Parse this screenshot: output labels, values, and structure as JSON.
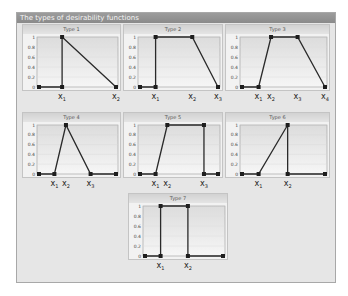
{
  "window": {
    "title": "The types of desirability functions"
  },
  "colors": {
    "line": "#2a2a2a",
    "marker": "#1e1e1e",
    "plot_bg": "#ececec",
    "plot_bg_top": "#dcdcdc",
    "frame_bg": "#e6e6e6",
    "title_bg": "#909090"
  },
  "chart_data": [
    {
      "type": "line",
      "title": "Type 1",
      "ylim": [
        0,
        1
      ],
      "yticks": [
        "1",
        "0.8",
        "0.6",
        "0.4",
        "0.2",
        "0"
      ],
      "x_labels": [
        {
          "name": "x",
          "sub": "1"
        },
        {
          "name": "x",
          "sub": "2"
        }
      ],
      "points": [
        [
          0,
          0
        ],
        [
          0.3,
          0
        ],
        [
          0.3,
          1
        ],
        [
          1,
          0
        ]
      ],
      "point_label_positions": [
        0.3,
        1.0
      ]
    },
    {
      "type": "line",
      "title": "Type 2",
      "ylim": [
        0,
        1
      ],
      "yticks": [
        "1",
        "0.8",
        "0.6",
        "0.4",
        "0.2",
        "0"
      ],
      "x_labels": [
        {
          "name": "x",
          "sub": "1"
        },
        {
          "name": "x",
          "sub": "2"
        },
        {
          "name": "x",
          "sub": "3"
        }
      ],
      "points": [
        [
          0,
          0
        ],
        [
          0.2,
          0
        ],
        [
          0.2,
          1
        ],
        [
          0.67,
          1
        ],
        [
          1,
          0
        ]
      ],
      "point_label_positions": [
        0.2,
        0.67,
        1.0
      ]
    },
    {
      "type": "line",
      "title": "Type 3",
      "ylim": [
        0,
        1
      ],
      "yticks": [
        "1",
        "0.8",
        "0.6",
        "0.4",
        "0.2",
        "0"
      ],
      "x_labels": [
        {
          "name": "x",
          "sub": "1"
        },
        {
          "name": "x",
          "sub": "2"
        },
        {
          "name": "x",
          "sub": "3"
        },
        {
          "name": "x",
          "sub": "4"
        }
      ],
      "points": [
        [
          0,
          0
        ],
        [
          0.2,
          0
        ],
        [
          0.35,
          1
        ],
        [
          0.67,
          1
        ],
        [
          1,
          0
        ]
      ],
      "point_label_positions": [
        0.2,
        0.35,
        0.67,
        1.0
      ]
    },
    {
      "type": "line",
      "title": "Type 4",
      "ylim": [
        0,
        1
      ],
      "yticks": [
        "1",
        "0.8",
        "0.6",
        "0.4",
        "0.2",
        "0"
      ],
      "x_labels": [
        {
          "name": "x",
          "sub": "1"
        },
        {
          "name": "x",
          "sub": "2"
        },
        {
          "name": "x",
          "sub": "3"
        }
      ],
      "points": [
        [
          0,
          0
        ],
        [
          0.2,
          0
        ],
        [
          0.35,
          1
        ],
        [
          0.67,
          0
        ],
        [
          1,
          0
        ]
      ],
      "point_label_positions": [
        0.2,
        0.35,
        0.67
      ]
    },
    {
      "type": "line",
      "title": "Type 5",
      "ylim": [
        0,
        1
      ],
      "yticks": [
        "1",
        "0.8",
        "0.6",
        "0.4",
        "0.2",
        "0"
      ],
      "x_labels": [
        {
          "name": "x",
          "sub": "1"
        },
        {
          "name": "x",
          "sub": "2"
        },
        {
          "name": "x",
          "sub": "3"
        }
      ],
      "points": [
        [
          0,
          0
        ],
        [
          0.2,
          0
        ],
        [
          0.35,
          1
        ],
        [
          0.82,
          1
        ],
        [
          0.82,
          0
        ],
        [
          1,
          0
        ]
      ],
      "point_label_positions": [
        0.2,
        0.35,
        0.82
      ]
    },
    {
      "type": "line",
      "title": "Type 6",
      "ylim": [
        0,
        1
      ],
      "yticks": [
        "1",
        "0.8",
        "0.6",
        "0.4",
        "0.2",
        "0"
      ],
      "x_labels": [
        {
          "name": "x",
          "sub": "1"
        },
        {
          "name": "x",
          "sub": "2"
        }
      ],
      "points": [
        [
          0,
          0
        ],
        [
          0.2,
          0
        ],
        [
          0.55,
          1
        ],
        [
          0.55,
          0
        ],
        [
          1,
          0
        ]
      ],
      "point_label_positions": [
        0.2,
        0.55
      ]
    },
    {
      "type": "line",
      "title": "Type 7",
      "ylim": [
        0,
        1
      ],
      "yticks": [
        "1",
        "0.8",
        "0.6",
        "0.4",
        "0.2",
        "0"
      ],
      "x_labels": [
        {
          "name": "x",
          "sub": "1"
        },
        {
          "name": "x",
          "sub": "2"
        }
      ],
      "points": [
        [
          0,
          0
        ],
        [
          0.2,
          0
        ],
        [
          0.2,
          1
        ],
        [
          0.55,
          1
        ],
        [
          0.55,
          0
        ],
        [
          1,
          0
        ]
      ],
      "point_label_positions": [
        0.2,
        0.55
      ]
    }
  ],
  "panels": [
    {
      "left": 22,
      "top": 24,
      "width": 99,
      "height": 67,
      "label_top": 93
    },
    {
      "left": 123,
      "top": 24,
      "width": 100,
      "height": 67,
      "label_top": 93
    },
    {
      "left": 225,
      "top": 24,
      "width": 105,
      "height": 67,
      "label_top": 93
    },
    {
      "left": 22,
      "top": 112,
      "width": 99,
      "height": 66,
      "label_top": 180
    },
    {
      "left": 123,
      "top": 112,
      "width": 100,
      "height": 66,
      "label_top": 180
    },
    {
      "left": 225,
      "top": 112,
      "width": 105,
      "height": 66,
      "label_top": 180
    },
    {
      "left": 128,
      "top": 193,
      "width": 100,
      "height": 67,
      "label_top": 262
    }
  ]
}
